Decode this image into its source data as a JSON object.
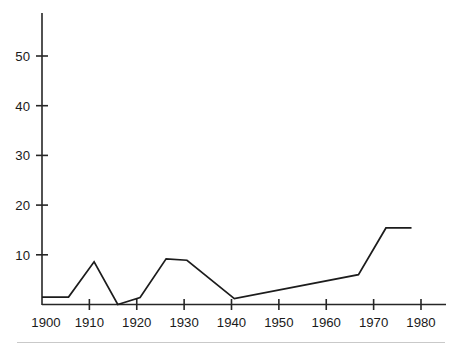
{
  "chart_data": {
    "type": "line",
    "title": "",
    "subtitle": "",
    "xlabel": "",
    "ylabel": "",
    "xlim": [
      1900,
      1981
    ],
    "ylim": [
      0,
      58
    ],
    "grid": false,
    "legend": null,
    "legend_position": "none",
    "x_ticks": [
      1900,
      1910,
      1920,
      1930,
      1940,
      1950,
      1960,
      1970,
      1980
    ],
    "x_tick_labels": [
      "1900",
      "1910",
      "1920",
      "1930",
      "1940",
      "1950",
      "1960",
      "1970",
      "1980"
    ],
    "y_ticks": [
      10,
      20,
      30,
      40,
      50
    ],
    "y_tick_labels": [
      "10",
      "20",
      "30",
      "40",
      "50"
    ],
    "series": [
      {
        "name": "series-1",
        "color": "#1c1c1c",
        "x": [
          1900,
          1905.6,
          1911,
          1916,
          1920.7,
          1926.2,
          1930.6,
          1940.6,
          1966.8,
          1972.6,
          1978
        ],
        "y": [
          1.5,
          1.5,
          8.6,
          0.0,
          1.4,
          9.2,
          8.9,
          1.2,
          6.0,
          15.4,
          15.4
        ],
        "points": [
          {
            "x": 1900,
            "y": 1.5
          },
          {
            "x": 1905.6,
            "y": 1.5
          },
          {
            "x": 1911,
            "y": 8.6
          },
          {
            "x": 1916,
            "y": 0.0
          },
          {
            "x": 1920.7,
            "y": 1.4
          },
          {
            "x": 1926.2,
            "y": 9.2
          },
          {
            "x": 1930.6,
            "y": 8.9
          },
          {
            "x": 1940.6,
            "y": 1.2
          },
          {
            "x": 1966.8,
            "y": 6.0
          },
          {
            "x": 1972.6,
            "y": 15.4
          },
          {
            "x": 1978,
            "y": 15.4
          }
        ]
      }
    ],
    "axis_colors": {
      "axis": "#262626",
      "line": "#1c1c1c",
      "text": "#1a1a1a",
      "background": "#ffffff",
      "footer_rule": "#c9c9c9"
    }
  },
  "figure": {
    "background": "#ffffff",
    "footer_rule_visible": "true"
  }
}
